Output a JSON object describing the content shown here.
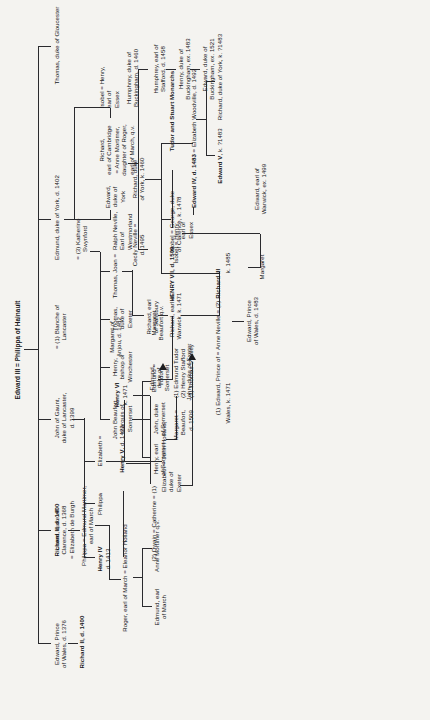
{
  "document": {
    "type": "genealogical-chart",
    "title": "The Plantagenet descent from Edward III",
    "orientation": "rotated-90-ccw",
    "page_background": "#f4f3f0",
    "ink_color": "#16161a"
  },
  "root": {
    "label": "Edward III = Philippa of Hainault"
  },
  "generation_1": [
    {
      "id": "edward-black-prince",
      "label": "Edward, Prince\nof Wales, d. 1376"
    },
    {
      "id": "lionel-clarence",
      "label": "Lionel, duke of\nClarence, d. 1368\n= Elizabeth de Burgh"
    },
    {
      "id": "john-of-gaunt",
      "label": "John of Gaunt,\nduke of Lancaster,\nd. 1399"
    },
    {
      "id": "john-of-gaunt-wife1",
      "label": "= (1) Blanche of\nLancaster"
    },
    {
      "id": "edmund-york",
      "label": "Edmund, duke of York, d. 1402"
    },
    {
      "id": "thomas-gloucester",
      "label": "Thomas, duke of Gloucester"
    }
  ],
  "gaunt_third_marriage": {
    "label": "= (3) Katherine\nSwynford"
  },
  "generation_2": [
    {
      "id": "richard-ii",
      "label": "Richard II, d. 1400",
      "bold": true
    },
    {
      "id": "philippa-mortimer",
      "label": "Philippa = Edmund Mortimer,\nearl of March"
    },
    {
      "id": "john-beaufort",
      "label": "John Beaufort,\nmarquis of\nSomerset"
    },
    {
      "id": "henry-winchester",
      "label": "Henry,\nbishop of\nWinchester"
    },
    {
      "id": "thomas-exeter",
      "label": "Thomas,\nduke of\nExeter"
    },
    {
      "id": "joan-neville",
      "label": "Thomas, Joan =  Ralph Neville,\n                      Earl of\n                      Westmorland"
    },
    {
      "id": "joan-beaufort",
      "label": "Joan ="
    },
    {
      "id": "ralph-neville",
      "label": "Ralph Neville,\nEarl of\nWestmorland"
    }
  ],
  "generation_3": [
    {
      "id": "roger-march",
      "label": "Roger, earl of March = Eleanor Holland"
    },
    {
      "id": "henry-somerset",
      "label": "Henry, earl\nof Somerset"
    },
    {
      "id": "john-somerset",
      "label": "John, duke\nof Somerset"
    },
    {
      "id": "edmund-somerset",
      "label": "Edmund,\nduke of\nSomerset"
    },
    {
      "id": "elizabeth-holland",
      "label": "Elizabeth = John Holland,\n                 duke of\n                 Exeter"
    },
    {
      "id": "edward-york-2",
      "label": "Edward,\nduke of\nYork"
    },
    {
      "id": "richard-cambridge",
      "label": "Richard,\nearl of Cambridge\n= Anne Mortimer,\ndaughter of Roger,\nearl of March, q.v."
    },
    {
      "id": "isobel-essex",
      "label": "Isobel =  Henry,\n               earl of\n               Essex"
    }
  ],
  "generation_4": [
    {
      "id": "anne-mortimer",
      "label": "Anne Mortimer q.v."
    },
    {
      "id": "edmund-march",
      "label": "Edmund, earl\nof March"
    },
    {
      "id": "henry-iv",
      "label": "Henry IV\nd. 1413",
      "bold_first_line": true
    },
    {
      "id": "philippa",
      "label": "Philippa"
    },
    {
      "id": "elizabeth",
      "label": "Elizabeth ="
    },
    {
      "id": "margaret-beaufort",
      "label": "Margaret =\nBeaufort,\nd. 1509"
    },
    {
      "id": "margaret-husbands",
      "label": "(1) Edmund Tudor\n(2) Henry Stafford\n(3) Thomas Stanley"
    },
    {
      "id": "john-exeter",
      "label": "John, duke of Exeter"
    },
    {
      "id": "humphrey-buckingham",
      "label": "Humphrey, duke of\nBuckingham, d. 1460"
    },
    {
      "id": "richard-york-3",
      "label": "Richard, duke\nof York, k. 1460"
    },
    {
      "id": "cecily-neville",
      "label": "Cecily Neville =\nd. 1495"
    }
  ],
  "generation_5": [
    {
      "id": "henry-v",
      "label": "Henry V, d. 1422",
      "bold_name": "Henry V"
    },
    {
      "id": "owain-catherine",
      "label": "(2) Owain = Catherine = (1)"
    },
    {
      "id": "richard-salisbury",
      "label": "Richard, earl\nof Salisbury"
    },
    {
      "id": "humphrey-stafford",
      "label": "Humphrey, earl of\nStafford, d. 1458"
    },
    {
      "id": "edward-iv",
      "label": "Edward IV, d. 1483 = Elizabeth Woodville, d. 1492"
    },
    {
      "id": "george-clarence",
      "label": "Isobel = George, duke\n             of Clarence, k. 1478"
    }
  ],
  "generation_6": [
    {
      "id": "henry-vi",
      "label": "Henry VI\nk. 1471",
      "consort": "Margaret of\nAnjou, d. 1482"
    },
    {
      "id": "edmund-tudor",
      "label": "Edmund =\nTudor"
    },
    {
      "id": "margaret-beaufort-qv",
      "label": "Margaret\nBeaufort q.v."
    },
    {
      "id": "richard-warwick",
      "label": "Richard, earl of\nWarwick, k. 1471"
    },
    {
      "id": "richard-iii",
      "label": "(1) Edward, Prince of = Anne Neville = (2) Richard III\nWales, k. 1471                                    k. 1485"
    },
    {
      "id": "henry-buckingham",
      "label": "Henry, duke of\nBuckingham, ex. 1483"
    },
    {
      "id": "edward-v",
      "label": "Edward V, k. ?1483"
    },
    {
      "id": "richard-york-4",
      "label": "Richard, duke of York, k. ?1483"
    }
  ],
  "generation_7": [
    {
      "id": "henry-vii",
      "label": "HENRY VII, d. 1509"
    },
    {
      "id": "edward-prince-wales",
      "label": "Edward, Prince\nof Wales, d. 1483"
    },
    {
      "id": "margaret",
      "label": "Margaret"
    },
    {
      "id": "edward-warwick",
      "label": "Edward, earl of\nWarwick, ex. 1499"
    },
    {
      "id": "edward-buckingham",
      "label": "Edward, duke of\nBuckingham, ex. 1521"
    }
  ],
  "footer": {
    "label": "Tudor and Stuart Monarchs"
  },
  "nodes": {
    "n_root": "Edward III = Philippa of Hainault",
    "n_edward_bp": "Edward, Prince\nof Wales, d. 1376",
    "n_richard_ii": "Richard II, d. 1400",
    "n_lionel": "Lionel, duke of\nClarence, d. 1368\n= Elizabeth de Burgh",
    "n_philippa_mortimer": "Philippa = Edmund Mortimer,\nearl of March",
    "n_roger_march": "Roger, earl of March = Eleanor Holland",
    "n_anne_mortimer": "Anne Mortimer q.v.",
    "n_edmund_march": "Edmund, earl\nof March",
    "n_gaunt": "John of Gaunt,\nduke of Lancaster,\nd. 1399",
    "n_blanche": "= (1) Blanche of\nLancaster",
    "n_katherine": "= (3) Katherine\nSwynford",
    "n_henry_iv": "Henry IV",
    "n_henry_iv_d": "d. 1413",
    "n_philippa": "Philippa",
    "n_elizabeth_eq": "Elizabeth =",
    "n_henry_v": "Henry V",
    "n_henry_v_d": ", d. 1422",
    "n_owain": "(2) Owain = Catherine = (1) ",
    "n_henry_vi": "Henry VI",
    "n_henry_vi_k": "k. 1471",
    "n_margaret_anjou": "Margaret of\nAnjou, d. 1482",
    "n_edmund_tudor": "Edmund =\nTudor",
    "n_margaret_beaufort_qv": "Margaret\nBeaufort q.v.",
    "n_henry_vii": "HENRY VII, d. 1509",
    "n_tudor_stuart": "Tudor and Stuart Monarchs",
    "n_john_beaufort": "John Beaufort,\nmarquis of\nSomerset",
    "n_henry_winchester": "Henry,\nbishop of\nWinchester",
    "n_thomas_exeter": "Thomas,\nduke of\nExeter",
    "n_joan_ralph": "Thomas, Joan =",
    "n_ralph_neville": "Ralph Neville,\nEarl of\nWestmorland",
    "n_henry_somerset": "Henry, earl\nof Somerset",
    "n_john_somerset": "John, duke\nof Somerset",
    "n_edmund_somerset": "Edmund,\nduke of\nSomerset",
    "n_elizabeth_holland": "Elizabeth = John Holland,\nduke of\nExeter",
    "n_margaret_beaufort": "Margaret =\nBeaufort,\nd. 1509",
    "n_margaret_husbands": "(1) Edmund Tudor\n(2) Henry Stafford\n(3) Thomas Stanley",
    "n_john_exeter": "John, duke of Exeter",
    "n_edmund_york": "Edmund, duke of York, d. 1402",
    "n_edward_york": "Edward,\nduke of\nYork",
    "n_richard_cambridge": "Richard,\nearl of Cambridge\n= Anne Mortimer,\ndaughter of Roger,\nearl of March, q.v.",
    "n_isobel_essex": "Isobel =  Henry,\nearl of\nEssex",
    "n_humphrey_buckingham": "Humphrey, duke of\nBuckingham, d. 1460",
    "n_humphrey_stafford": "Humphrey, earl of\nStafford, d. 1458",
    "n_henry_buckingham": "Henry, duke of\nBuckingham, ex. 1483",
    "n_edward_buckingham": "Edward, duke of\nBuckingham, ex. 1521",
    "n_cecily_neville": "Cecily Neville =\nd. 1495",
    "n_richard_york": "Richard, duke\nof York, k. 1460",
    "n_richard_salisbury": "Richard, earl\nof Salisbury",
    "n_richard_warwick": "Richard, earl of\nWarwick, k. 1471",
    "n_isobel_george": "Isobel = George, duke\nof Clarence, k. 1478",
    "n_edward_iv": "Edward IV, d. 1483",
    "n_edward_iv_wife": " = Elizabeth Woodville, d. 1492",
    "n_edward_anne_richard_a": "(1) Edward, Prince of = Anne Neville = (2) ",
    "n_edward_anne_richard_b": "Richard III",
    "n_edward_anne_wales": "Wales, k. 1471",
    "n_richard_iii_k": "k. 1485",
    "n_edward_pow": "Edward, Prince\nof Wales, d. 1483",
    "n_margaret": "Margaret",
    "n_edward_warwick": "Edward, earl of\nWarwick, ex. 1499",
    "n_edward_v": "Edward V",
    "n_edward_v_k": ", k. ?1483",
    "n_richard_duke_york": "Richard, duke of York, k. ?1483",
    "n_thomas_gloucester": "Thomas, duke of Gloucester"
  }
}
